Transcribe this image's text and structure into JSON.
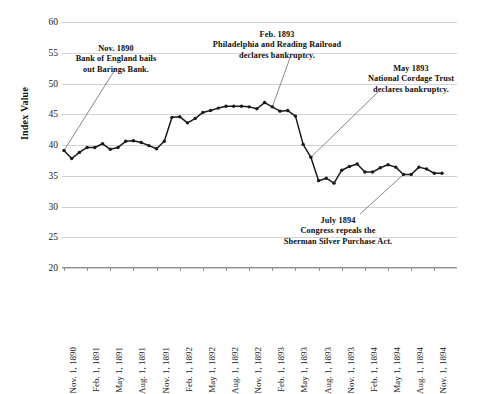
{
  "chart_data": {
    "type": "line",
    "title": "",
    "subtitle": "",
    "xlabel": "",
    "ylabel": "Index Value",
    "ylim": [
      20,
      60
    ],
    "ytick_labels": [
      "60",
      "55",
      "50",
      "45",
      "40",
      "35",
      "30",
      "25",
      "20"
    ],
    "ytick_values": [
      60,
      55,
      50,
      45,
      40,
      35,
      30,
      25,
      20
    ],
    "grid": true,
    "legend": null,
    "marker": "filled-circle",
    "line_color": "#1a1a1a",
    "grid_color": "#d2d2d2",
    "xtick_labels": [
      "Nov. 1, 1890",
      "Feb. 1, 1891",
      "May 1, 1891",
      "Aug. 1, 1891",
      "Nov. 1, 1891",
      "Feb. 1, 1892",
      "May 1, 1892",
      "Aug. 1, 1892",
      "Nov. 1, 1892",
      "Feb. 1, 1893",
      "May 1, 1893",
      "Aug. 1, 1893",
      "Nov. 1, 1893",
      "Feb. 1, 1894",
      "May 1, 1894",
      "Aug. 1, 1894",
      "Nov. 1, 1894"
    ],
    "x": [
      "Nov. 1, 1890",
      "Dec. 1, 1890",
      "Jan. 1, 1891",
      "Feb. 1, 1891",
      "Mar. 1, 1891",
      "Apr. 1, 1891",
      "May 1, 1891",
      "Jun. 1, 1891",
      "Jul. 1, 1891",
      "Aug. 1, 1891",
      "Sep. 1, 1891",
      "Oct. 1, 1891",
      "Nov. 1, 1891",
      "Dec. 1, 1891",
      "Jan. 1, 1892",
      "Feb. 1, 1892",
      "Mar. 1, 1892",
      "Apr. 1, 1892",
      "May 1, 1892",
      "Jun. 1, 1892",
      "Jul. 1, 1892",
      "Aug. 1, 1892",
      "Sep. 1, 1892",
      "Oct. 1, 1892",
      "Nov. 1, 1892",
      "Dec. 1, 1892",
      "Jan. 1, 1893",
      "Feb. 1, 1893",
      "Mar. 1, 1893",
      "Apr. 1, 1893",
      "May 1, 1893",
      "Jun. 1, 1893",
      "Jul. 1, 1893",
      "Aug. 1, 1893",
      "Sep. 1, 1893",
      "Oct. 1, 1893",
      "Nov. 1, 1893",
      "Dec. 1, 1893",
      "Jan. 1, 1894",
      "Feb. 1, 1894",
      "Mar. 1, 1894",
      "Apr. 1, 1894",
      "May 1, 1894",
      "Jun. 1, 1894",
      "Jul. 1, 1894",
      "Aug. 1, 1894",
      "Sep. 1, 1894",
      "Oct. 1, 1894",
      "Nov. 1, 1894",
      "Dec. 1, 1894"
    ],
    "values": [
      39.1,
      37.8,
      38.8,
      39.6,
      39.6,
      40.2,
      39.3,
      39.6,
      40.6,
      40.7,
      40.4,
      39.9,
      39.4,
      40.6,
      44.5,
      44.6,
      43.6,
      44.3,
      45.3,
      45.6,
      46.0,
      46.3,
      46.3,
      46.3,
      46.2,
      45.9,
      46.9,
      46.2,
      45.5,
      45.6,
      44.7,
      40.1,
      38.0,
      34.2,
      34.6,
      33.8,
      35.9,
      36.5,
      36.9,
      35.6,
      35.6,
      36.3,
      36.8,
      36.4,
      35.2,
      35.2,
      36.4,
      36.1,
      35.4,
      35.4
    ],
    "annotations": [
      {
        "name": "barings-annotation",
        "title": "Nov. 1890",
        "line1": "Bank of England bails",
        "line2": "out Barings Bank.",
        "points_to_value": 39.1,
        "points_to_x": "Nov. 1, 1890"
      },
      {
        "name": "philadelphia-reading-annotation",
        "title": "Feb. 1893",
        "line1": "Philadelphia and Reading Railroad",
        "line2": "declares bankruptcy.",
        "points_to_value": 45.5,
        "points_to_x": "Feb. 1, 1893"
      },
      {
        "name": "national-cordage-annotation",
        "title": "May 1893",
        "line1": "National Cordage Trust",
        "line2": "declares bankruptcy.",
        "points_to_value": 38.0,
        "points_to_x": "May 1, 1893"
      },
      {
        "name": "sherman-silver-annotation",
        "title": "July 1894",
        "line1": "Congress repeals the",
        "line2": "Sherman Silver Purchase Act.",
        "points_to_value": 35.2,
        "points_to_x": "July 1, 1894"
      }
    ]
  }
}
